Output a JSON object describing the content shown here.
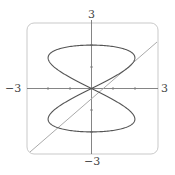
{
  "chart_data": {
    "type": "line",
    "title": "",
    "xlabel": "",
    "ylabel": "",
    "xlim": [
      -3,
      3
    ],
    "ylim": [
      -3,
      3
    ],
    "tick_labels": {
      "x_min": "−3",
      "x_max": "3",
      "y_min": "−3",
      "y_max": "3"
    },
    "x_ticks": [
      -2,
      -1,
      1,
      2
    ],
    "y_ticks": [
      -2,
      -1,
      1,
      2
    ],
    "grid": false,
    "series": [
      {
        "name": "parametric curve",
        "description": "figure-eight: x = 2 sin(2t), y = 2 sin(t)",
        "color": "#555555"
      },
      {
        "name": "line",
        "description": "y = x",
        "color": "#aaaaaa"
      }
    ]
  },
  "labels": {
    "x_min": "−3",
    "x_max": "3",
    "y_max": "3",
    "y_min": "−3"
  }
}
